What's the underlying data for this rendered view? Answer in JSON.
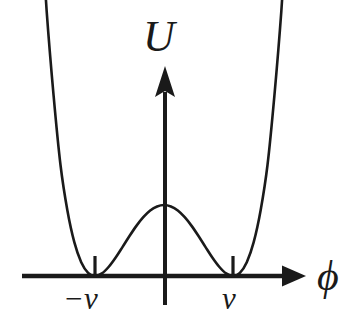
{
  "figure": {
    "kind": "line-plot",
    "background_color": "#ffffff",
    "ink_color": "#1a1a1a",
    "width": 360,
    "height": 331
  },
  "labels": {
    "y_axis": "U",
    "x_axis": "ϕ",
    "tick_left": "−v",
    "tick_right": "v"
  },
  "chart_data": {
    "type": "line",
    "title": "",
    "subtitle": "",
    "xlabel": "ϕ",
    "ylabel": "U",
    "grid": false,
    "legend": null,
    "function": "U = (phi^2 - v^2)^2",
    "xlim": [
      -2.05,
      2.05
    ],
    "ylim": [
      0,
      10.4
    ],
    "xticks": [
      -1,
      1
    ],
    "xticklabels": [
      "−v",
      "v"
    ],
    "yticks": [],
    "yticklabels": [],
    "annotations": [
      {
        "text": "minimum",
        "x": -1,
        "y": 0
      },
      {
        "text": "local maximum",
        "x": 0,
        "y": 1
      },
      {
        "text": "minimum",
        "x": 1,
        "y": 0
      }
    ],
    "x": [
      -2.0,
      -1.9,
      -1.8,
      -1.7,
      -1.6,
      -1.5,
      -1.4,
      -1.3,
      -1.2,
      -1.1,
      -1.0,
      -0.9,
      -0.8,
      -0.7,
      -0.6,
      -0.5,
      -0.4,
      -0.3,
      -0.2,
      -0.1,
      0.0,
      0.1,
      0.2,
      0.3,
      0.4,
      0.5,
      0.6,
      0.7,
      0.8,
      0.9,
      1.0,
      1.1,
      1.2,
      1.3,
      1.4,
      1.5,
      1.6,
      1.7,
      1.8,
      1.9,
      2.0
    ],
    "y": [
      9.0,
      6.972,
      5.198,
      3.724,
      2.54,
      1.563,
      0.922,
      0.476,
      0.194,
      0.044,
      0.0,
      0.036,
      0.13,
      0.26,
      0.41,
      0.563,
      0.706,
      0.828,
      0.922,
      0.98,
      1.0,
      0.98,
      0.922,
      0.828,
      0.706,
      0.563,
      0.41,
      0.26,
      0.13,
      0.036,
      0.0,
      0.044,
      0.194,
      0.476,
      0.922,
      1.563,
      2.54,
      3.724,
      5.198,
      6.972,
      9.0
    ],
    "series": [
      {
        "name": "U(ϕ)",
        "color": "#1a1a1a",
        "linewidth": 2.6,
        "values": [
          9.0,
          6.972,
          5.198,
          3.724,
          2.54,
          1.563,
          0.922,
          0.476,
          0.194,
          0.044,
          0.0,
          0.036,
          0.13,
          0.26,
          0.41,
          0.563,
          0.706,
          0.828,
          0.922,
          0.98,
          1.0,
          0.98,
          0.922,
          0.828,
          0.706,
          0.563,
          0.41,
          0.26,
          0.13,
          0.036,
          0.0,
          0.044,
          0.194,
          0.476,
          0.922,
          1.563,
          2.54,
          3.724,
          5.198,
          6.972,
          9.0
        ]
      }
    ]
  },
  "geometry": {
    "x_axis": {
      "y": 276,
      "x_start": 22,
      "x_end": 305,
      "arrow": "right"
    },
    "y_axis": {
      "x": 165,
      "y_top": 67,
      "y_bottom": 305,
      "arrow": "up"
    },
    "minima_px": [
      95,
      233
    ],
    "peak_px": {
      "x": 165,
      "y": 205
    },
    "tick_px": [
      {
        "x": 95,
        "y_top": 257,
        "y_bottom": 276
      },
      {
        "x": 233,
        "y_top": 257,
        "y_bottom": 276
      }
    ]
  }
}
